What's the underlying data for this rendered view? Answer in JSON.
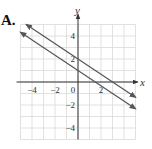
{
  "option_label": "A.",
  "chart_data": {
    "type": "line",
    "title": "",
    "xlabel": "x",
    "ylabel": "y",
    "xlim": [
      -5,
      5
    ],
    "ylim": [
      -5,
      5
    ],
    "grid": true,
    "x_ticks": [
      "-4",
      "-2",
      "0",
      "2"
    ],
    "y_ticks": [
      "4",
      "2",
      "-2",
      "-4"
    ],
    "series": [
      {
        "name": "upper line",
        "equation": "y = -2/3 x + 2",
        "points": [
          [
            -4.5,
            5
          ],
          [
            0,
            2
          ],
          [
            3,
            0
          ],
          [
            5,
            -1.33
          ]
        ]
      },
      {
        "name": "lower line",
        "equation": "y = -2/3 x + 1",
        "points": [
          [
            -5,
            4.33
          ],
          [
            0,
            1
          ],
          [
            1.5,
            0
          ],
          [
            5,
            -2.33
          ]
        ]
      }
    ],
    "line_color": "#555555",
    "grid_color": "#d9d9d9",
    "axis_color": "#333333"
  }
}
